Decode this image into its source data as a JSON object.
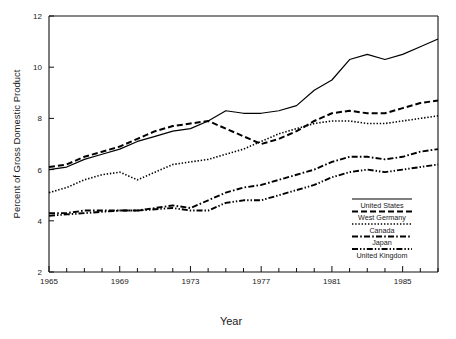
{
  "chart_data": {
    "type": "line",
    "title": "",
    "xlabel": "Year",
    "ylabel": "Percent of Gross Domestic Product",
    "xlim": [
      1965,
      1987
    ],
    "ylim": [
      2,
      12
    ],
    "grid": false,
    "legend_position": "bottom-right",
    "x_ticks_labeled": [
      "1965",
      "1969",
      "1973",
      "1977",
      "1981",
      "1985"
    ],
    "x_ticks_all": [
      1965,
      1966,
      1967,
      1968,
      1969,
      1970,
      1971,
      1972,
      1973,
      1974,
      1975,
      1976,
      1977,
      1978,
      1979,
      1980,
      1981,
      1982,
      1983,
      1984,
      1985,
      1986,
      1987
    ],
    "y_ticks": [
      "2",
      "4",
      "6",
      "8",
      "10",
      "12"
    ],
    "x": [
      1965,
      1966,
      1967,
      1968,
      1969,
      1970,
      1971,
      1972,
      1973,
      1974,
      1975,
      1976,
      1977,
      1978,
      1979,
      1980,
      1981,
      1982,
      1983,
      1984,
      1985,
      1986,
      1987
    ],
    "series": [
      {
        "name": "United States",
        "style": "solid",
        "values": [
          6.0,
          6.1,
          6.4,
          6.6,
          6.8,
          7.1,
          7.3,
          7.5,
          7.6,
          7.9,
          8.3,
          8.2,
          8.2,
          8.3,
          8.5,
          9.1,
          9.5,
          10.3,
          10.5,
          10.3,
          10.5,
          10.8,
          11.1
        ]
      },
      {
        "name": "West Germany",
        "style": "dashed",
        "values": [
          6.1,
          6.2,
          6.5,
          6.7,
          6.9,
          7.2,
          7.5,
          7.7,
          7.8,
          7.9,
          7.6,
          7.3,
          7.0,
          7.2,
          7.5,
          7.9,
          8.2,
          8.3,
          8.2,
          8.2,
          8.4,
          8.6,
          8.7
        ]
      },
      {
        "name": "Canada",
        "style": "dotted",
        "values": [
          5.1,
          5.3,
          5.6,
          5.8,
          5.9,
          5.6,
          5.9,
          6.2,
          6.3,
          6.4,
          6.6,
          6.8,
          7.1,
          7.4,
          7.6,
          7.8,
          7.9,
          7.9,
          7.8,
          7.8,
          7.9,
          8.0,
          8.1
        ]
      },
      {
        "name": "Japan",
        "style": "dashdot",
        "values": [
          4.3,
          4.3,
          4.4,
          4.4,
          4.4,
          4.4,
          4.5,
          4.6,
          4.5,
          4.8,
          5.1,
          5.3,
          5.4,
          5.6,
          5.8,
          6.0,
          6.3,
          6.5,
          6.5,
          6.4,
          6.5,
          6.7,
          6.8
        ]
      },
      {
        "name": "United Kingdom",
        "style": "dashdotdot",
        "values": [
          4.2,
          4.25,
          4.3,
          4.35,
          4.4,
          4.4,
          4.45,
          4.5,
          4.4,
          4.4,
          4.7,
          4.8,
          4.8,
          5.0,
          5.2,
          5.4,
          5.7,
          5.9,
          6.0,
          5.9,
          6.0,
          6.1,
          6.2
        ]
      }
    ]
  },
  "legend": {
    "items": [
      {
        "label": "United States"
      },
      {
        "label": "West Germany"
      },
      {
        "label": "Canada"
      },
      {
        "label": "Japan"
      },
      {
        "label": "United Kingdom"
      }
    ]
  },
  "axes": {
    "x_title": "Year",
    "y_title": "Percent of Gross Domestic Product"
  }
}
